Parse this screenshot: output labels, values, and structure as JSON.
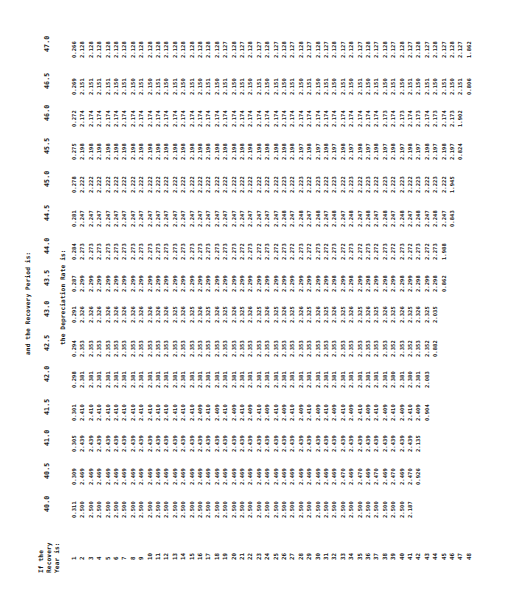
{
  "table": {
    "title_top": "and the Recovery Period is:",
    "title_sub": "the Depreciation Rate is:",
    "row_header_lines": [
      "If the",
      "Recovery",
      "Year is:"
    ],
    "recovery_periods": [
      "40.0",
      "40.5",
      "41.0",
      "41.5",
      "42.0",
      "42.5",
      "43.0",
      "43.5",
      "44.0",
      "44.5",
      "45.0",
      "45.5",
      "46.0",
      "46.5",
      "47.0"
    ],
    "recovery_years": [
      "1",
      "2",
      "3",
      "4",
      "5",
      "6",
      "7",
      "8",
      "9",
      "10",
      "11",
      "12",
      "13",
      "14",
      "15",
      "16",
      "17",
      "18",
      "19",
      "20",
      "21",
      "22",
      "23",
      "24",
      "25",
      "26",
      "27",
      "28",
      "29",
      "30",
      "31",
      "32",
      "33",
      "34",
      "35",
      "36",
      "37",
      "38",
      "39",
      "40",
      "41",
      "42",
      "43",
      "44",
      "45",
      "46",
      "47",
      "48"
    ],
    "columns": [
      {
        "period": "40.0",
        "values": [
          "0.311",
          "2.500",
          "2.500",
          "2.500",
          "2.500",
          "2.500",
          "2.500",
          "2.500",
          "2.500",
          "2.500",
          "2.500",
          "2.500",
          "2.500",
          "2.500",
          "2.500",
          "2.500",
          "2.500",
          "2.500",
          "2.500",
          "2.500",
          "2.500",
          "2.500",
          "2.500",
          "2.500",
          "2.500",
          "2.500",
          "2.500",
          "2.500",
          "2.500",
          "2.500",
          "2.500",
          "2.500",
          "2.500",
          "2.500",
          "2.500",
          "2.500",
          "2.500",
          "2.500",
          "2.500",
          "2.500",
          "2.187"
        ]
      },
      {
        "period": "40.5",
        "values": [
          "0.309",
          "2.469",
          "2.469",
          "2.469",
          "2.469",
          "2.469",
          "2.469",
          "2.469",
          "2.469",
          "2.469",
          "2.469",
          "2.469",
          "2.469",
          "2.469",
          "2.469",
          "2.469",
          "2.469",
          "2.469",
          "2.469",
          "2.469",
          "2.469",
          "2.469",
          "2.469",
          "2.469",
          "2.469",
          "2.469",
          "2.469",
          "2.469",
          "2.469",
          "2.469",
          "2.469",
          "2.469",
          "2.470",
          "2.469",
          "2.470",
          "2.469",
          "2.470",
          "2.469",
          "2.470",
          "2.469",
          "2.470",
          "0.926"
        ]
      },
      {
        "period": "41.0",
        "values": [
          "0.305",
          "2.439",
          "2.439",
          "2.439",
          "2.439",
          "2.439",
          "2.439",
          "2.439",
          "2.439",
          "2.439",
          "2.439",
          "2.439",
          "2.439",
          "2.439",
          "2.439",
          "2.439",
          "2.439",
          "2.439",
          "2.439",
          "2.439",
          "2.439",
          "2.439",
          "2.439",
          "2.439",
          "2.439",
          "2.439",
          "2.439",
          "2.439",
          "2.439",
          "2.439",
          "2.439",
          "2.439",
          "2.439",
          "2.439",
          "2.439",
          "2.439",
          "2.439",
          "2.439",
          "2.439",
          "2.439",
          "2.439",
          "2.135"
        ]
      },
      {
        "period": "41.5",
        "values": [
          "0.301",
          "2.410",
          "2.410",
          "2.410",
          "2.410",
          "2.410",
          "2.410",
          "2.410",
          "2.410",
          "2.410",
          "2.410",
          "2.410",
          "2.410",
          "2.410",
          "2.410",
          "2.409",
          "2.410",
          "2.409",
          "2.410",
          "2.409",
          "2.410",
          "2.409",
          "2.410",
          "2.409",
          "2.410",
          "2.409",
          "2.410",
          "2.409",
          "2.410",
          "2.409",
          "2.410",
          "2.409",
          "2.410",
          "2.409",
          "2.410",
          "2.409",
          "2.410",
          "2.409",
          "2.410",
          "2.409",
          "2.410",
          "2.409",
          "0.904"
        ]
      },
      {
        "period": "42.0",
        "values": [
          "0.298",
          "2.381",
          "2.381",
          "2.381",
          "2.381",
          "2.381",
          "2.381",
          "2.381",
          "2.381",
          "2.381",
          "2.381",
          "2.381",
          "2.381",
          "2.381",
          "2.381",
          "2.381",
          "2.381",
          "2.381",
          "2.381",
          "2.381",
          "2.381",
          "2.381",
          "2.381",
          "2.381",
          "2.381",
          "2.381",
          "2.381",
          "2.381",
          "2.381",
          "2.381",
          "2.381",
          "2.381",
          "2.381",
          "2.381",
          "2.381",
          "2.381",
          "2.381",
          "2.381",
          "2.380",
          "2.381",
          "2.380",
          "2.381",
          "2.083"
        ]
      },
      {
        "period": "42.5",
        "values": [
          "0.294",
          "2.353",
          "2.353",
          "2.353",
          "2.353",
          "2.353",
          "2.353",
          "2.353",
          "2.353",
          "2.353",
          "2.353",
          "2.353",
          "2.353",
          "2.353",
          "2.353",
          "2.353",
          "2.353",
          "2.353",
          "2.353",
          "2.353",
          "2.353",
          "2.353",
          "2.353",
          "2.353",
          "2.353",
          "2.353",
          "2.353",
          "2.353",
          "2.353",
          "2.353",
          "2.353",
          "2.353",
          "2.353",
          "2.353",
          "2.353",
          "2.353",
          "2.353",
          "2.353",
          "2.352",
          "2.353",
          "2.352",
          "2.353",
          "2.352",
          "0.882"
        ]
      },
      {
        "period": "43.0",
        "values": [
          "0.291",
          "2.326",
          "2.326",
          "2.326",
          "2.326",
          "2.326",
          "2.326",
          "2.326",
          "2.326",
          "2.326",
          "2.326",
          "2.326",
          "2.325",
          "2.326",
          "2.325",
          "2.326",
          "2.325",
          "2.326",
          "2.325",
          "2.326",
          "2.325",
          "2.326",
          "2.325",
          "2.326",
          "2.325",
          "2.326",
          "2.325",
          "2.326",
          "2.325",
          "2.326",
          "2.325",
          "2.326",
          "2.325",
          "2.326",
          "2.325",
          "2.326",
          "2.325",
          "2.326",
          "2.325",
          "2.326",
          "2.325",
          "2.326",
          "2.325",
          "2.035"
        ]
      },
      {
        "period": "43.5",
        "values": [
          "0.287",
          "2.299",
          "2.299",
          "2.299",
          "2.299",
          "2.299",
          "2.299",
          "2.299",
          "2.299",
          "2.299",
          "2.299",
          "2.299",
          "2.299",
          "2.299",
          "2.299",
          "2.299",
          "2.299",
          "2.299",
          "2.299",
          "2.299",
          "2.299",
          "2.299",
          "2.299",
          "2.299",
          "2.299",
          "2.299",
          "2.299",
          "2.299",
          "2.299",
          "2.299",
          "2.299",
          "2.298",
          "2.299",
          "2.298",
          "2.299",
          "2.298",
          "2.299",
          "2.298",
          "2.299",
          "2.298",
          "2.299",
          "2.298",
          "2.299",
          "2.298",
          "0.862"
        ]
      },
      {
        "period": "44.0",
        "values": [
          "0.284",
          "2.273",
          "2.273",
          "2.273",
          "2.273",
          "2.273",
          "2.273",
          "2.273",
          "2.273",
          "2.273",
          "2.273",
          "2.273",
          "2.273",
          "2.273",
          "2.273",
          "2.273",
          "2.273",
          "2.273",
          "2.273",
          "2.273",
          "2.272",
          "2.273",
          "2.272",
          "2.273",
          "2.272",
          "2.273",
          "2.272",
          "2.273",
          "2.272",
          "2.273",
          "2.272",
          "2.273",
          "2.272",
          "2.273",
          "2.272",
          "2.273",
          "2.272",
          "2.273",
          "2.272",
          "2.273",
          "2.272",
          "2.273",
          "2.272",
          "2.273",
          "1.988"
        ]
      },
      {
        "period": "44.5",
        "values": [
          "0.281",
          "2.247",
          "2.247",
          "2.247",
          "2.247",
          "2.247",
          "2.247",
          "2.247",
          "2.247",
          "2.247",
          "2.247",
          "2.247",
          "2.247",
          "2.247",
          "2.247",
          "2.247",
          "2.247",
          "2.247",
          "2.247",
          "2.247",
          "2.247",
          "2.247",
          "2.247",
          "2.247",
          "2.247",
          "2.248",
          "2.247",
          "2.248",
          "2.247",
          "2.248",
          "2.247",
          "2.248",
          "2.247",
          "2.248",
          "2.247",
          "2.248",
          "2.247",
          "2.248",
          "2.247",
          "2.248",
          "2.247",
          "2.248",
          "2.247",
          "2.248",
          "2.247",
          "0.843"
        ]
      },
      {
        "period": "45.0",
        "values": [
          "0.278",
          "2.222",
          "2.222",
          "2.222",
          "2.222",
          "2.222",
          "2.222",
          "2.222",
          "2.222",
          "2.222",
          "2.222",
          "2.222",
          "2.222",
          "2.222",
          "2.222",
          "2.222",
          "2.222",
          "2.222",
          "2.222",
          "2.222",
          "2.222",
          "2.222",
          "2.222",
          "2.222",
          "2.222",
          "2.223",
          "2.222",
          "2.223",
          "2.222",
          "2.223",
          "2.222",
          "2.223",
          "2.222",
          "2.223",
          "2.222",
          "2.223",
          "2.222",
          "2.223",
          "2.222",
          "2.223",
          "2.222",
          "2.223",
          "2.222",
          "2.223",
          "2.222",
          "1.945"
        ]
      },
      {
        "period": "45.5",
        "values": [
          "0.275",
          "2.198",
          "2.198",
          "2.198",
          "2.198",
          "2.198",
          "2.198",
          "2.198",
          "2.198",
          "2.198",
          "2.198",
          "2.198",
          "2.198",
          "2.198",
          "2.198",
          "2.198",
          "2.198",
          "2.198",
          "2.198",
          "2.198",
          "2.198",
          "2.198",
          "2.198",
          "2.198",
          "2.198",
          "2.198",
          "2.198",
          "2.197",
          "2.198",
          "2.197",
          "2.198",
          "2.197",
          "2.198",
          "2.197",
          "2.198",
          "2.197",
          "2.198",
          "2.197",
          "2.198",
          "2.197",
          "2.198",
          "2.197",
          "2.198",
          "2.197",
          "2.198",
          "2.197",
          "0.824"
        ]
      },
      {
        "period": "46.0",
        "values": [
          "0.272",
          "2.174",
          "2.174",
          "2.174",
          "2.174",
          "2.174",
          "2.174",
          "2.174",
          "2.174",
          "2.174",
          "2.174",
          "2.174",
          "2.174",
          "2.174",
          "2.174",
          "2.174",
          "2.174",
          "2.174",
          "2.174",
          "2.174",
          "2.174",
          "2.174",
          "2.174",
          "2.174",
          "2.174",
          "2.174",
          "2.174",
          "2.174",
          "2.174",
          "2.174",
          "2.174",
          "2.174",
          "2.174",
          "2.174",
          "2.174",
          "2.174",
          "2.174",
          "2.173",
          "2.174",
          "2.173",
          "2.174",
          "2.173",
          "2.174",
          "2.173",
          "2.174",
          "2.173",
          "1.902"
        ]
      },
      {
        "period": "46.5",
        "values": [
          "0.269",
          "2.151",
          "2.151",
          "2.151",
          "2.151",
          "2.150",
          "2.151",
          "2.150",
          "2.151",
          "2.150",
          "2.151",
          "2.150",
          "2.151",
          "2.150",
          "2.151",
          "2.150",
          "2.151",
          "2.150",
          "2.151",
          "2.150",
          "2.151",
          "2.150",
          "2.151",
          "2.150",
          "2.151",
          "2.150",
          "2.151",
          "2.150",
          "2.151",
          "2.150",
          "2.151",
          "2.150",
          "2.151",
          "2.150",
          "2.151",
          "2.150",
          "2.151",
          "2.150",
          "2.151",
          "2.150",
          "2.151",
          "2.150",
          "2.151",
          "2.150",
          "2.151",
          "2.150",
          "2.151",
          "0.806"
        ]
      },
      {
        "period": "47.0",
        "values": [
          "0.266",
          "2.128",
          "2.128",
          "2.128",
          "2.128",
          "2.128",
          "2.128",
          "2.128",
          "2.128",
          "2.128",
          "2.128",
          "2.128",
          "2.128",
          "2.128",
          "2.128",
          "2.128",
          "2.128",
          "2.128",
          "2.127",
          "2.128",
          "2.127",
          "2.128",
          "2.127",
          "2.128",
          "2.127",
          "2.128",
          "2.127",
          "2.128",
          "2.127",
          "2.128",
          "2.127",
          "2.128",
          "2.127",
          "2.128",
          "2.127",
          "2.128",
          "2.127",
          "2.128",
          "2.127",
          "2.128",
          "2.127",
          "2.128",
          "2.127",
          "2.128",
          "2.127",
          "2.128",
          "2.127",
          "1.862"
        ]
      }
    ]
  }
}
